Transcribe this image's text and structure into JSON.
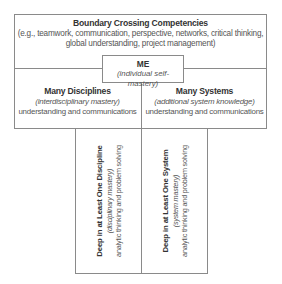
{
  "diagram": {
    "boundary": {
      "title": "Boundary Crossing Competencies",
      "line1": "(e.g., teamwork, communication, perspective, networks, critical thinking,",
      "line2": "global understanding, project management)"
    },
    "me": {
      "title": "ME",
      "subtitle": "(individual self-mastery)"
    },
    "many_disciplines": {
      "title": "Many Disciplines",
      "subtitle": "(interdisciplinary mastery)",
      "description": "understanding and communications"
    },
    "many_systems": {
      "title": "Many Systems",
      "subtitle": "(additional system knowledge)",
      "description": "understanding and communications"
    },
    "deep_discipline": {
      "title": "Deep in at Least One Discipline",
      "subtitle": "(disciplinary mastery)",
      "description": "analytic thinking and problem solving"
    },
    "deep_system": {
      "title": "Deep in at Least One System",
      "subtitle": "(system mastery)",
      "description": "analytic thinking and problem solving"
    }
  },
  "colors": {
    "border": "#8a8a8a",
    "title_text": "#333333",
    "body_text": "#555555",
    "background": "#ffffff"
  }
}
